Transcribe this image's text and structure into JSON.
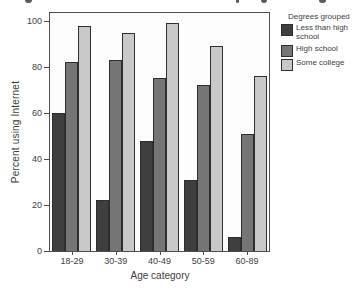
{
  "chart_data": {
    "type": "bar",
    "categories": [
      "18-29",
      "30-39",
      "40-49",
      "50-59",
      "60-89"
    ],
    "series": [
      {
        "name": "Less than high school",
        "color": "#3f3f3f",
        "values": [
          60,
          22,
          48,
          31,
          6
        ]
      },
      {
        "name": "High school",
        "color": "#757575",
        "values": [
          82,
          83,
          75,
          72,
          51
        ]
      },
      {
        "name": "Some college",
        "color": "#c8c8c8",
        "values": [
          98,
          95,
          99,
          89,
          76
        ]
      }
    ],
    "xlabel": "Age category",
    "ylabel": "Percent using Internet",
    "ylim": [
      0,
      100
    ],
    "yticks": [
      0,
      20,
      40,
      60,
      80,
      100
    ],
    "legend_title": "Degrees grouped",
    "legend_position": "right",
    "grid": false
  },
  "colors": {
    "background": "#ffffff",
    "axis": "#4f4f4f",
    "text": "#3d3d3d",
    "bar_border": "#2e2e2e"
  }
}
